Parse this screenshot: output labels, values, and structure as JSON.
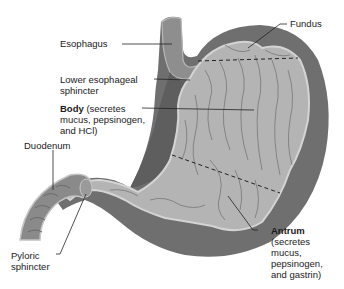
{
  "diagram": {
    "type": "anatomical-illustration",
    "colors": {
      "background": "#ffffff",
      "outer_wall": "#6f6f6f",
      "muscle_layer": "#8c8c8c",
      "mucosa": "#b4b4b4",
      "mucosa_edge": "#d0d0d0",
      "rugae": "#7e7e7e",
      "leader_line": "#222222",
      "dashed_boundary": "#222222"
    },
    "labels": {
      "fundus": "Fundus",
      "esophagus": "Esophagus",
      "lower_esophageal_sphincter_1": "Lower esophageal",
      "lower_esophageal_sphincter_2": "sphincter",
      "body_bold": "Body",
      "body_1": " (secretes",
      "body_2": "mucus, pepsinogen,",
      "body_3": "and HCl)",
      "duodenum": "Duodenum",
      "pyloric_sphincter_1": "Pyloric",
      "pyloric_sphincter_2": "sphincter",
      "antrum_bold": "Antrum",
      "antrum_1": "(secretes",
      "antrum_2": "mucus,",
      "antrum_3": "pepsinogen,",
      "antrum_4": "and gastrin)"
    },
    "regions": [
      "Fundus",
      "Body",
      "Antrum"
    ],
    "boundaries": [
      "Fundus/Body dashed line",
      "Body/Antrum dashed line"
    ]
  }
}
